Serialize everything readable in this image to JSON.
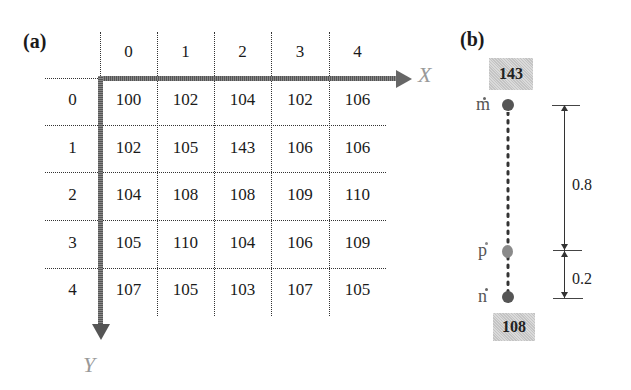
{
  "panel_a": {
    "label": "(a)",
    "x_axis_label": "X",
    "y_axis_label": "Y",
    "column_headers": [
      "0",
      "1",
      "2",
      "3",
      "4"
    ],
    "row_headers": [
      "0",
      "1",
      "2",
      "3",
      "4"
    ],
    "grid": [
      [
        "100",
        "102",
        "104",
        "102",
        "106"
      ],
      [
        "102",
        "105",
        "143",
        "106",
        "106"
      ],
      [
        "104",
        "108",
        "108",
        "109",
        "110"
      ],
      [
        "105",
        "110",
        "104",
        "106",
        "109"
      ],
      [
        "107",
        "105",
        "103",
        "107",
        "105"
      ]
    ]
  },
  "panel_b": {
    "label": "(b)",
    "top_value": "143",
    "bottom_value": "108",
    "points": {
      "m": "m",
      "p": "p",
      "n": "n"
    },
    "distances": {
      "upper": "0.8",
      "lower": "0.2"
    }
  },
  "colors": {
    "axis_arrow": "#777777",
    "value_box": "#cfcfcf",
    "dot_dark": "#555555",
    "dot_light": "#8a8a8a"
  }
}
